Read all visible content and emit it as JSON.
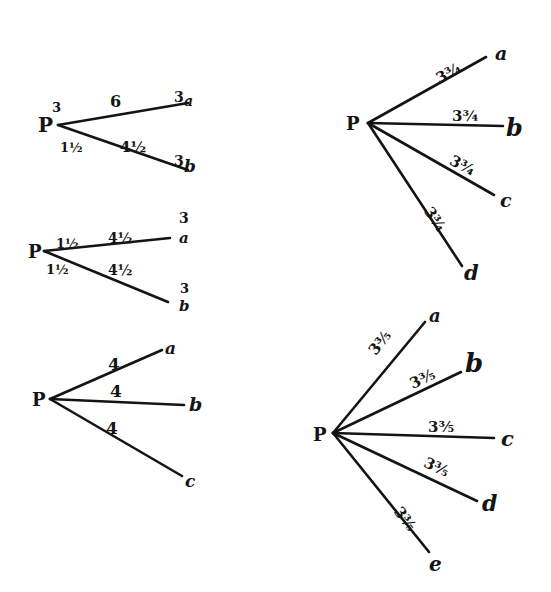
{
  "figure": {
    "ink_color": "#141414",
    "background": "#ffffff"
  },
  "diagrams": [
    {
      "id": "d1",
      "origin": "P",
      "origin_superscript": "3",
      "rays": [
        {
          "to": "a",
          "end_label": "3",
          "weight": "6",
          "inner": ""
        },
        {
          "to": "b",
          "end_label": "3",
          "weight": "4½",
          "inner": "1½"
        }
      ]
    },
    {
      "id": "d2",
      "origin": "P",
      "rays": [
        {
          "to": "a",
          "end_label": "3",
          "weight": "4½",
          "inner": "1½"
        },
        {
          "to": "b",
          "end_label": "3",
          "weight": "4½",
          "inner": "1½"
        }
      ]
    },
    {
      "id": "d3",
      "origin": "P",
      "rays": [
        {
          "to": "a",
          "weight": "4"
        },
        {
          "to": "b",
          "weight": "4"
        },
        {
          "to": "c",
          "weight": "4"
        }
      ]
    },
    {
      "id": "d4",
      "origin": "P",
      "rays": [
        {
          "to": "a",
          "weight": "3¾"
        },
        {
          "to": "b",
          "weight": "3¾"
        },
        {
          "to": "c",
          "weight": "3¾"
        },
        {
          "to": "d",
          "weight": "3¾"
        }
      ]
    },
    {
      "id": "d5",
      "origin": "P",
      "rays": [
        {
          "to": "a",
          "weight": "3⅗"
        },
        {
          "to": "b",
          "weight": "3⅗"
        },
        {
          "to": "c",
          "weight": "3⅗"
        },
        {
          "to": "d",
          "weight": "3⅗"
        },
        {
          "to": "e",
          "weight": "3⅗"
        }
      ]
    }
  ]
}
